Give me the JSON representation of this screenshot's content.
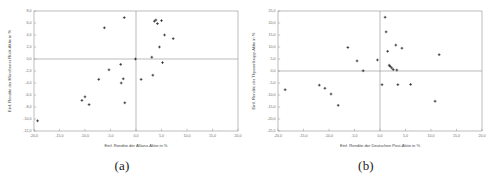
{
  "figure": {
    "panels": [
      {
        "id": "a",
        "caption": "(a)",
        "chart_data": {
          "type": "scatter",
          "title": "",
          "xlabel": "Einf. Rendite der Allianz-Aktie in %",
          "ylabel": "Einf. Rendite der Münchener Rück-Aktie in %",
          "xlim": [
            -20.0,
            20.0
          ],
          "ylim": [
            -12.0,
            8.0
          ],
          "xticks": [
            "-20,0",
            "-15,0",
            "-10,0",
            "-5,0",
            "0,0",
            "5,0",
            "10,0",
            "15,0",
            "20,0"
          ],
          "xtick_values": [
            -20.0,
            -15.0,
            -10.0,
            -5.0,
            0.0,
            5.0,
            10.0,
            15.0,
            20.0
          ],
          "yticks": [
            "8,0",
            "6,0",
            "4,0",
            "2,0",
            "0,0",
            "-2,0",
            "-4,0",
            "-6,0",
            "-8,0",
            "-10,0",
            "-12,0"
          ],
          "ytick_values": [
            8.0,
            6.0,
            4.0,
            2.0,
            0.0,
            -2.0,
            -4.0,
            -6.0,
            -8.0,
            -10.0,
            -12.0
          ],
          "grid": false,
          "legend": "none",
          "marker": "cross",
          "marker_color": "#222222",
          "zero_lines": true,
          "points": [
            {
              "x": -19.3,
              "y": -10.3
            },
            {
              "x": -10.6,
              "y": -6.9
            },
            {
              "x": -10.0,
              "y": -6.3
            },
            {
              "x": -9.2,
              "y": -7.6
            },
            {
              "x": -7.3,
              "y": -3.4
            },
            {
              "x": -6.2,
              "y": 5.2
            },
            {
              "x": -5.3,
              "y": -1.8
            },
            {
              "x": -3.0,
              "y": -0.9
            },
            {
              "x": -2.9,
              "y": -4.0
            },
            {
              "x": -2.5,
              "y": -3.3
            },
            {
              "x": -2.3,
              "y": 6.9
            },
            {
              "x": -2.2,
              "y": -7.3
            },
            {
              "x": -0.1,
              "y": 0.0
            },
            {
              "x": 1.0,
              "y": -3.4
            },
            {
              "x": 3.1,
              "y": 0.3
            },
            {
              "x": 3.3,
              "y": -2.7
            },
            {
              "x": 3.6,
              "y": 6.3
            },
            {
              "x": 3.9,
              "y": 6.5
            },
            {
              "x": 4.2,
              "y": 5.9
            },
            {
              "x": 4.6,
              "y": 2.0
            },
            {
              "x": 5.0,
              "y": 6.4
            },
            {
              "x": 5.2,
              "y": -0.6
            },
            {
              "x": 5.6,
              "y": 4.0
            },
            {
              "x": 7.3,
              "y": 3.4
            }
          ]
        }
      },
      {
        "id": "b",
        "caption": "(b)",
        "chart_data": {
          "type": "scatter",
          "title": "",
          "xlabel": "Einf. Rendite der Deutschen Post-Aktie in %",
          "ylabel": "Einf. Rendite der Thyssenkrupp-Aktie in %",
          "xlim": [
            -20.0,
            20.0
          ],
          "ylim": [
            -25.0,
            25.0
          ],
          "xticks": [
            "-20,0",
            "-15,0",
            "-10,0",
            "-5,0",
            "0,0",
            "5,0",
            "10,0",
            "15,0",
            "20,0"
          ],
          "xtick_values": [
            -20.0,
            -15.0,
            -10.0,
            -5.0,
            0.0,
            5.0,
            10.0,
            15.0,
            20.0
          ],
          "yticks": [
            "25,0",
            "20,0",
            "15,0",
            "10,0",
            "5,0",
            "0,0",
            "-5,0",
            "-10,0",
            "-15,0",
            "-20,0",
            "-25,0"
          ],
          "ytick_values": [
            25.0,
            20.0,
            15.0,
            10.0,
            5.0,
            0.0,
            -5.0,
            -10.0,
            -15.0,
            -20.0,
            -25.0
          ],
          "grid": false,
          "legend": "none",
          "marker": "cross",
          "marker_color": "#222222",
          "zero_lines": true,
          "points": [
            {
              "x": -18.6,
              "y": -7.8
            },
            {
              "x": -11.9,
              "y": -5.9
            },
            {
              "x": -10.8,
              "y": -7.2
            },
            {
              "x": -9.6,
              "y": -9.6
            },
            {
              "x": -8.2,
              "y": -14.3
            },
            {
              "x": -6.3,
              "y": 9.8
            },
            {
              "x": -4.5,
              "y": 4.2
            },
            {
              "x": -3.3,
              "y": 0.1
            },
            {
              "x": -0.5,
              "y": 4.6
            },
            {
              "x": 0.4,
              "y": -5.7
            },
            {
              "x": 1.0,
              "y": 22.4
            },
            {
              "x": 1.2,
              "y": 16.3
            },
            {
              "x": 1.5,
              "y": 8.2
            },
            {
              "x": 1.8,
              "y": 2.4
            },
            {
              "x": 2.0,
              "y": 1.9
            },
            {
              "x": 2.3,
              "y": 1.3
            },
            {
              "x": 2.6,
              "y": 0.6
            },
            {
              "x": 3.1,
              "y": 10.8
            },
            {
              "x": 3.3,
              "y": 0.4
            },
            {
              "x": 3.5,
              "y": -5.7
            },
            {
              "x": 4.3,
              "y": 9.5
            },
            {
              "x": 6.0,
              "y": -5.6
            },
            {
              "x": 10.8,
              "y": -12.6
            },
            {
              "x": 11.6,
              "y": 6.8
            }
          ]
        }
      }
    ]
  }
}
